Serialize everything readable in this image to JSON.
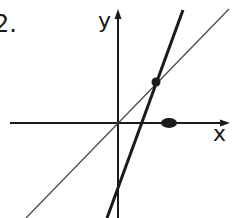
{
  "problem": {
    "number_label": "2."
  },
  "axes": {
    "x_label": "x",
    "y_label": "y"
  },
  "lines": [
    {
      "name": "line-y-equals-x",
      "style": "thin",
      "description": "thin line through origin"
    },
    {
      "name": "steep-line",
      "style": "thick",
      "description": "thick steep line with negative y-intercept"
    }
  ],
  "points": [
    {
      "name": "intersection-point",
      "description": "intersection of the two lines"
    },
    {
      "name": "x-axis-point",
      "description": "marked point on positive x-axis"
    }
  ],
  "colors": {
    "ink": "#1a1a1a",
    "thin_line": "#4a4a4a",
    "background": "#ffffff"
  }
}
